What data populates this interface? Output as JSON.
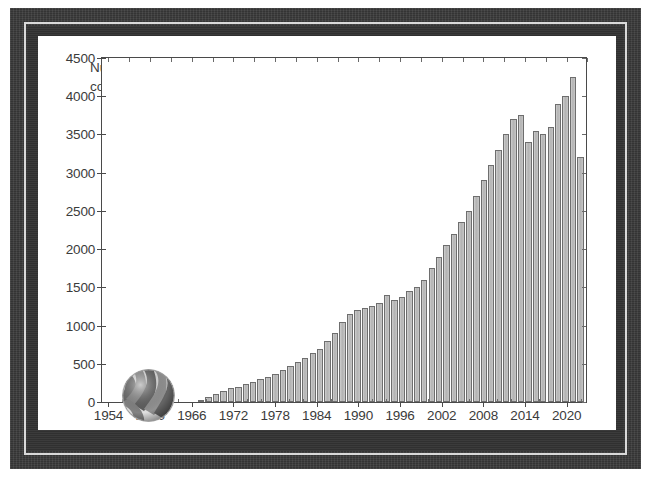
{
  "figure": {
    "frame_color": "#333333",
    "frame_line_color": "#d9d9d9",
    "canvas_color": "#ffffff",
    "bar_fill_color": "#bdbdbd",
    "bar_edge_color": "#6e6e6e",
    "axis_color": "#4a4a4a",
    "annotation_line1": "Number of publications per year",
    "annotation_line2": "containing term \"LDL-cholesterol\"",
    "decoration_name": "striped-sphere-graphic"
  },
  "chart_data": {
    "type": "bar",
    "title": "Number of publications per year containing term \"LDL-cholesterol\"",
    "xlabel": "",
    "ylabel": "",
    "xlim": [
      1953,
      2023
    ],
    "ylim": [
      0,
      4500
    ],
    "ytick_values": [
      0,
      500,
      1000,
      1500,
      2000,
      2500,
      3000,
      3500,
      4000,
      4500
    ],
    "ytick_labels": [
      "0",
      "500",
      "1000",
      "1500",
      "2000",
      "2500",
      "3000",
      "3500",
      "4000",
      "4500"
    ],
    "xtick_values": [
      1954,
      1960,
      1966,
      1972,
      1978,
      1984,
      1990,
      1996,
      2002,
      2008,
      2014,
      2020
    ],
    "xtick_labels": [
      "1954",
      "1960",
      "1966",
      "1972",
      "1978",
      "1984",
      "1990",
      "1996",
      "2002",
      "2008",
      "2014",
      "2020"
    ],
    "grid": false,
    "legend": false,
    "categories": [
      1954,
      1955,
      1956,
      1957,
      1958,
      1959,
      1960,
      1961,
      1962,
      1963,
      1964,
      1965,
      1966,
      1967,
      1968,
      1969,
      1970,
      1971,
      1972,
      1973,
      1974,
      1975,
      1976,
      1977,
      1978,
      1979,
      1980,
      1981,
      1982,
      1983,
      1984,
      1985,
      1986,
      1987,
      1988,
      1989,
      1990,
      1991,
      1992,
      1993,
      1994,
      1995,
      1996,
      1997,
      1998,
      1999,
      2000,
      2001,
      2002,
      2003,
      2004,
      2005,
      2006,
      2007,
      2008,
      2009,
      2010,
      2011,
      2012,
      2013,
      2014,
      2015,
      2016,
      2017,
      2018,
      2019,
      2020,
      2021,
      2022
    ],
    "values": [
      0,
      0,
      0,
      0,
      0,
      0,
      0,
      0,
      0,
      0,
      0,
      0,
      0,
      0,
      0,
      0,
      0,
      30,
      60,
      110,
      150,
      180,
      200,
      230,
      260,
      300,
      330,
      360,
      420,
      470,
      520,
      580,
      640,
      700,
      800,
      900,
      1050,
      1150,
      1200,
      1230,
      1250,
      1300,
      1400,
      1330,
      1380,
      1450,
      1500,
      1600,
      1750,
      1900,
      2050,
      2200,
      2350,
      2500,
      2700,
      2900,
      3100,
      3300,
      3500,
      3700,
      3750,
      3400,
      3550,
      3500,
      3600,
      3900,
      4000,
      4250,
      3200
    ]
  }
}
